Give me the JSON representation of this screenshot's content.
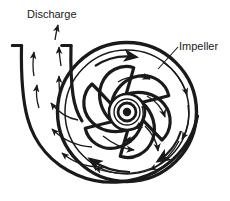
{
  "figure": {
    "kind": "engineering-line-diagram",
    "background_color": "#ffffff",
    "line_color": "#1a1a1a"
  },
  "labels": {
    "discharge": "Discharge",
    "impeller": "Impeller"
  },
  "annotations": {
    "impeller_leader_line": "leader from Impeller text down-left to impeller blade",
    "discharge_arrows": "upward flow arrows in the discharge nozzle",
    "volute_arrows": "curved arrows in volute channel pointing toward discharge",
    "impeller_arrows": "curved arrows on blades showing clockwise rotation"
  },
  "geometry": {
    "impeller_center": [
      127,
      112
    ],
    "impeller_outer_radius": 70,
    "hub_radii": [
      4,
      9,
      13,
      18
    ],
    "blade_count": 6,
    "nozzle_left_wall_x": 18,
    "nozzle_right_wall_x": 70,
    "nozzle_top_y": 45
  }
}
